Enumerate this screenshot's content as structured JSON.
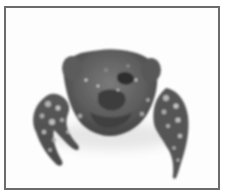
{
  "figure": {
    "colors": {
      "background": "#ffffff",
      "frame_border": "#6b6b6b",
      "photo_background": "#fdfdfd",
      "carapace_dark": "#4a4a4a",
      "carapace_mid": "#6e6e6e",
      "spots_light": "#b5b5b5"
    }
  }
}
